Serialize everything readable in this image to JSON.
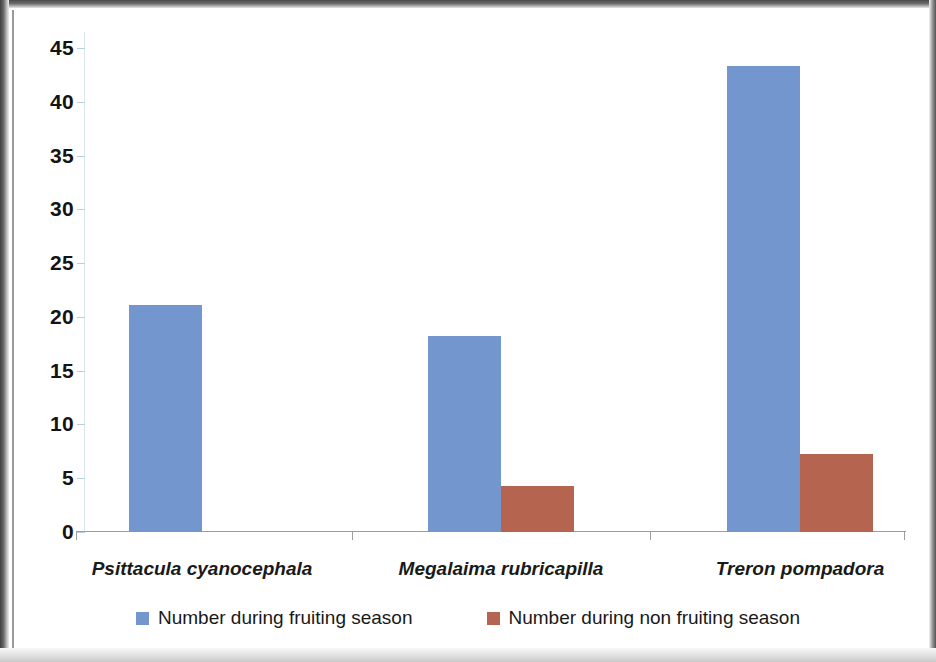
{
  "chart_data": {
    "type": "bar",
    "title": "",
    "xlabel": "",
    "ylabel": "",
    "categories": [
      "Psittacula cyanocephala",
      "Megalaima rubricapilla",
      "Treron pompadora"
    ],
    "series": [
      {
        "name": "Number during fruiting season",
        "color": "#7396ce",
        "values": [
          21.1,
          18.2,
          43.3
        ]
      },
      {
        "name": "Number during non fruiting season",
        "color": "#b5654f",
        "values": [
          0,
          4.3,
          7.3
        ]
      }
    ],
    "ylim": [
      0,
      45
    ],
    "yticks": [
      0,
      5,
      10,
      15,
      20,
      25,
      30,
      35,
      40,
      45
    ],
    "ytick_labels": [
      "0",
      "5",
      "10",
      "15",
      "20",
      "25",
      "30",
      "35",
      "40",
      "45"
    ],
    "grid": false,
    "legend_position": "bottom"
  },
  "legend": {
    "items": [
      {
        "label": "Number during fruiting season",
        "color": "#7396ce"
      },
      {
        "label": "Number during non fruiting season",
        "color": "#b5654f"
      }
    ]
  }
}
